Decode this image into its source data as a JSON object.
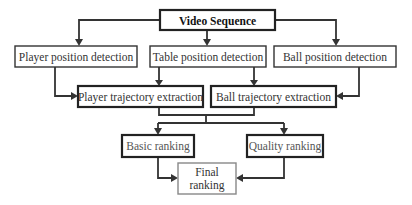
{
  "diagram": {
    "type": "flowchart",
    "nodes": {
      "video_sequence": "Video Sequence",
      "player_position_detection": "Player position detection",
      "table_position_detection": "Table position detection",
      "ball_position_detection": "Ball position detection",
      "player_trajectory_extraction": "Player trajectory extraction",
      "ball_trajectory_extraction": "Ball trajectory extraction",
      "basic_ranking": "Basic ranking",
      "quality_ranking": "Quality ranking",
      "final_ranking_line1": "Final",
      "final_ranking_line2": "ranking"
    },
    "edges": [
      {
        "from": "Video Sequence",
        "to": "Player position detection"
      },
      {
        "from": "Video Sequence",
        "to": "Table position detection"
      },
      {
        "from": "Video Sequence",
        "to": "Ball position detection"
      },
      {
        "from": "Player position detection",
        "to": "Player trajectory extraction"
      },
      {
        "from": "Table position detection",
        "to": "Player trajectory extraction"
      },
      {
        "from": "Table position detection",
        "to": "Ball trajectory extraction"
      },
      {
        "from": "Ball position detection",
        "to": "Ball trajectory extraction"
      },
      {
        "from": "Player trajectory extraction",
        "to": "Basic ranking"
      },
      {
        "from": "Player trajectory extraction",
        "to": "Quality ranking"
      },
      {
        "from": "Ball trajectory extraction",
        "to": "Basic ranking"
      },
      {
        "from": "Ball trajectory extraction",
        "to": "Quality ranking"
      },
      {
        "from": "Basic ranking",
        "to": "Final ranking"
      },
      {
        "from": "Quality ranking",
        "to": "Final ranking"
      }
    ]
  }
}
